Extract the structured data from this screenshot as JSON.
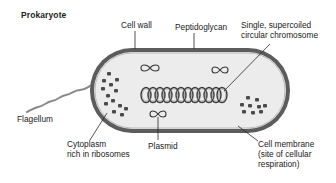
{
  "title": "Prokaryote",
  "labels": {
    "cell_wall": "Cell wall",
    "peptidoglycan": "Peptidoglycan",
    "chromosome_line1": "Single, supercoiled",
    "chromosome_line2": "circular chromosome",
    "flagellum": "Flagellum",
    "cytoplasm_line1": "Cytoplasm",
    "cytoplasm_line2": "rich in ribosomes",
    "plasmid": "Plasmid",
    "membrane_line1": "Cell membrane",
    "membrane_line2": "(site of cellular",
    "membrane_line3": "respiration)"
  },
  "colors": {
    "cell_wall": "#5c5c5c",
    "cytoplasm": "#ececec",
    "ribosome": "#4a4a4a",
    "chromosome": "#3a3a3a",
    "flagellum": "#8a8a8a",
    "leader_line": "#2a2a2a",
    "text": "#222222"
  }
}
